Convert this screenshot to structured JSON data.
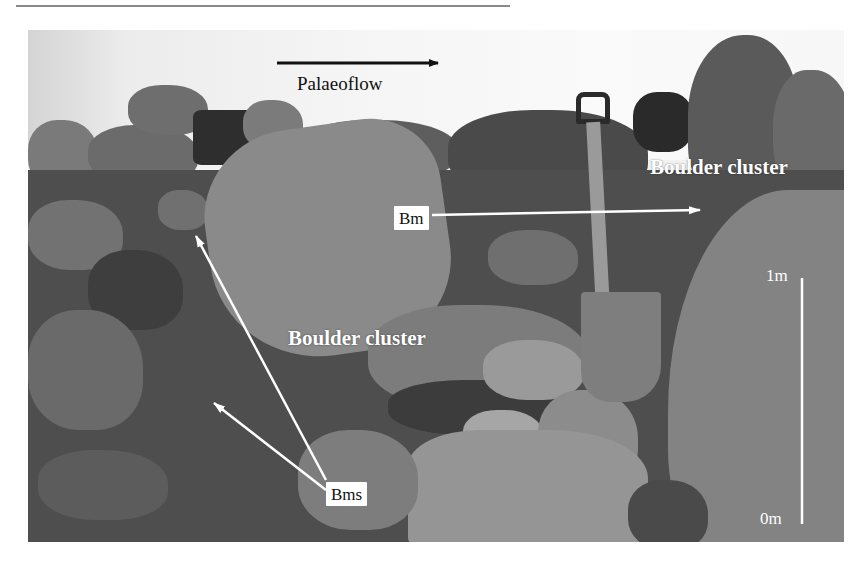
{
  "figure": {
    "type": "field photograph (grayscale)",
    "palaeoflow_label": "Palaeoflow",
    "palaeoflow_direction": "right",
    "annotations": {
      "boulder_cluster_upper": "Boulder cluster",
      "boulder_cluster_center": "Boulder cluster",
      "bm_label": "Bm",
      "bms_label": "Bms"
    },
    "scale_bar": {
      "top_label": "1m",
      "bottom_label": "0m"
    },
    "colors": {
      "annotation_text": "#ffffff",
      "label_box_bg": "#ffffff",
      "label_box_text": "#111111",
      "palaeoflow_arrow": "#111111"
    }
  }
}
